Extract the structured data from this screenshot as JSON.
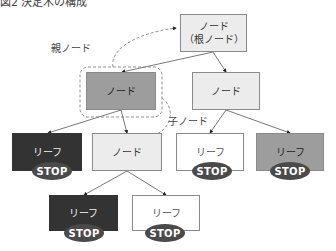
{
  "title": "図2 決定木の構成",
  "colors": {
    "light": "#ececec",
    "mid": "#9d9d9d",
    "dark": "#333333",
    "white": "#ffffff",
    "stop": "#4a4a4a"
  },
  "nodes": {
    "root": {
      "line1": "ノード",
      "line2": "（根ノード）"
    },
    "left": {
      "label": "ノード"
    },
    "right": {
      "label": "ノード"
    },
    "l3_1": {
      "label": "リーフ"
    },
    "l3_2": {
      "label": "ノード"
    },
    "l3_3": {
      "label": "リーフ"
    },
    "l3_4": {
      "label": "リーフ"
    },
    "l4_1": {
      "label": "リーフ"
    },
    "l4_2": {
      "label": "リーフ"
    }
  },
  "stop_label": "STOP",
  "annotations": {
    "parent": "親ノード",
    "child": "子ノード"
  }
}
